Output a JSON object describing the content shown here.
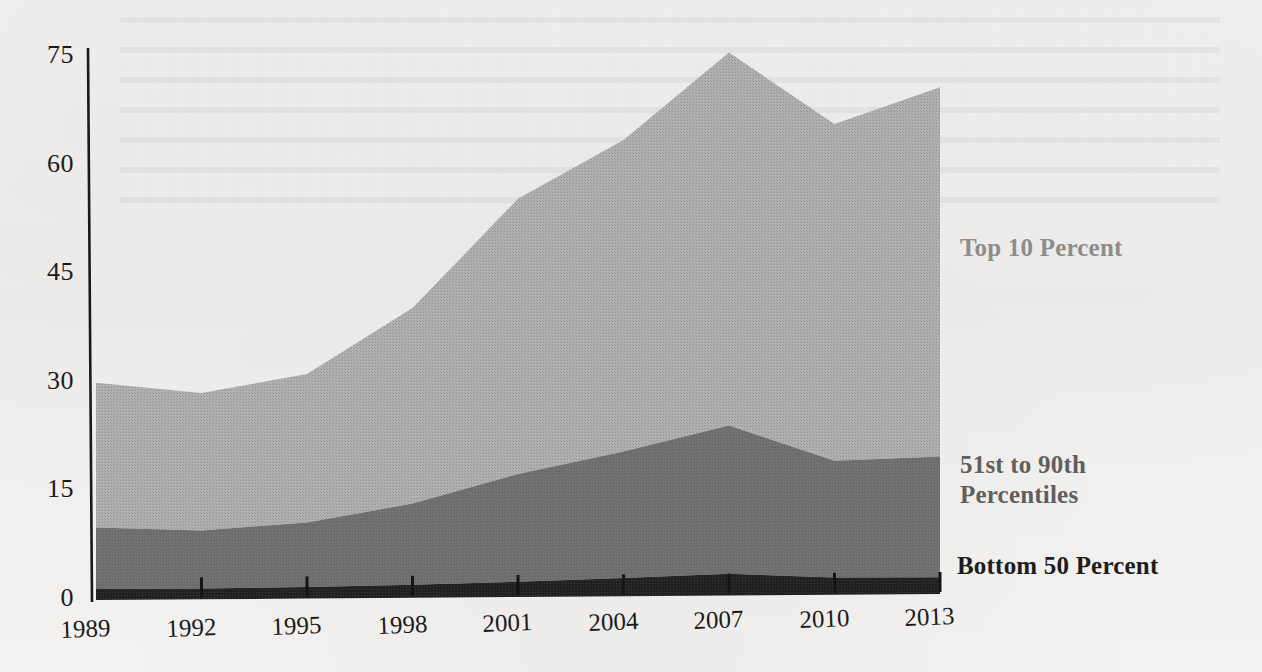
{
  "chart_data": {
    "type": "area",
    "stacked": true,
    "title": "",
    "subtitle": "",
    "xlabel": "",
    "ylabel": "",
    "categories": [
      1989,
      1992,
      1995,
      1998,
      2001,
      2004,
      2007,
      2010,
      2013
    ],
    "x_tick_labels": [
      "1989",
      "1992",
      "1995",
      "1998",
      "2001",
      "2004",
      "2007",
      "2010",
      "2013"
    ],
    "y_tick_labels": [
      "0",
      "15",
      "30",
      "45",
      "60",
      "75"
    ],
    "y_ticks": [
      0,
      15,
      30,
      45,
      60,
      75
    ],
    "ylim": [
      0,
      75
    ],
    "xlim": [
      1989,
      2013
    ],
    "grid": false,
    "legend_position": "right-inline",
    "series": [
      {
        "name": "Bottom 50 Percent",
        "color": "#1d1d1d",
        "label_color": "#1d1d1d",
        "values": [
          1.5,
          1.5,
          1.6,
          1.8,
          2.1,
          2.5,
          3.0,
          2.4,
          2.3
        ]
      },
      {
        "name": "51st to 90th Percentiles",
        "color": "#6e6e6e",
        "label_color": "#5f5f5f",
        "values": [
          8.5,
          8.0,
          8.9,
          11.2,
          14.9,
          17.5,
          20.5,
          16.1,
          16.7
        ]
      },
      {
        "name": "Top 10 Percent",
        "color": "#a9a9a9",
        "label_color": "#8d8d8d",
        "values": [
          20.0,
          19.0,
          20.5,
          27.0,
          38.0,
          43.0,
          51.5,
          46.5,
          51.0
        ]
      }
    ],
    "cumulative_totals": {
      "bottom_50": [
        1.5,
        1.5,
        1.6,
        1.8,
        2.1,
        2.5,
        3.0,
        2.4,
        2.3
      ],
      "through_90th": [
        10.0,
        9.5,
        10.5,
        13.0,
        17.0,
        20.0,
        23.5,
        18.5,
        19.0
      ],
      "total": [
        30.0,
        28.5,
        31.0,
        40.0,
        55.0,
        63.0,
        75.0,
        65.0,
        70.0
      ]
    },
    "annotations": [
      {
        "text": "Top 10 Percent",
        "color": "#8d8d8d"
      },
      {
        "text": "51st to 90th\nPercentiles",
        "color": "#5f5f5f"
      },
      {
        "text": "Bottom 50 Percent",
        "color": "#1d1d1d"
      }
    ]
  },
  "axis": {
    "y_axis_name": "y-axis",
    "x_axis_name": "x-axis"
  }
}
